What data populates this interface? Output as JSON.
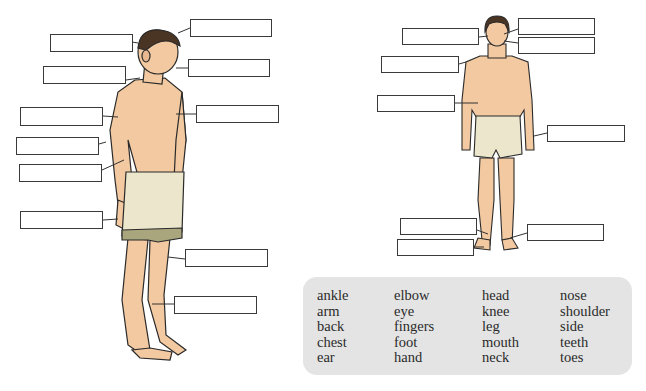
{
  "worksheet": {
    "figures": [
      {
        "name": "side-view-man",
        "label_boxes": 10
      },
      {
        "name": "front-view-man",
        "label_boxes": 9
      }
    ],
    "word_bank": {
      "columns": [
        [
          "ankle",
          "arm",
          "back",
          "chest",
          "ear"
        ],
        [
          "elbow",
          "eye",
          "fingers",
          "foot",
          "hand"
        ],
        [
          "head",
          "knee",
          "leg",
          "mouth",
          "neck"
        ],
        [
          "nose",
          "shoulder",
          "side",
          "teeth",
          "toes"
        ]
      ]
    },
    "colors": {
      "skin": "#f2c9a0",
      "shorts": "#ebe6cc",
      "shorts_hem": "#a9a67e",
      "hair": "#4a3424",
      "word_bank_bg": "#e4e4e4"
    }
  }
}
